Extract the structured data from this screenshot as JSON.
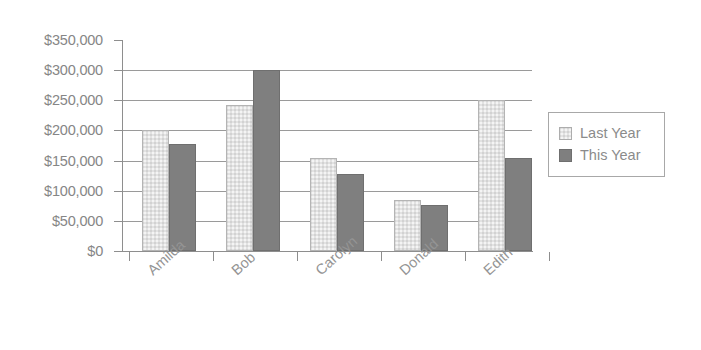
{
  "chart_data": {
    "type": "bar",
    "title": "",
    "subtitle": "",
    "xlabel": "",
    "ylabel": "",
    "categories": [
      "Amilda",
      "Bob",
      "Carolyn",
      "Donald",
      "Edith"
    ],
    "series": [
      {
        "name": "Last Year",
        "color": "#e2e2e2",
        "values": [
          200000,
          242000,
          155000,
          85000,
          250000
        ]
      },
      {
        "name": "This Year",
        "color": "#7f7f7f",
        "values": [
          178000,
          300000,
          128000,
          77000,
          155000
        ]
      }
    ],
    "ylim": [
      0,
      350000
    ],
    "ytick_values": [
      0,
      50000,
      100000,
      150000,
      200000,
      250000,
      300000,
      350000
    ],
    "ytick_labels": [
      "$0",
      "$50,000",
      "$100,000",
      "$150,000",
      "$200,000",
      "$250,000",
      "$300,000",
      "$350,000"
    ],
    "gridlines_at": [
      50000,
      100000,
      150000,
      200000,
      250000,
      300000
    ],
    "grid": true,
    "legend_position": "right",
    "axis_color": "#8e8e8e",
    "grid_color": "#9a9a9a",
    "text_color": "#8b8b8b",
    "xtick_label_rotation": -42,
    "annotations": []
  },
  "legend": {
    "entries": [
      {
        "label": "Last Year"
      },
      {
        "label": "This Year"
      }
    ]
  }
}
